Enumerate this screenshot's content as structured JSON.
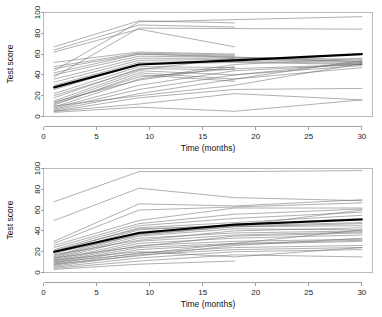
{
  "figure": {
    "title": "",
    "panel_count": 2
  },
  "chart_data": [
    {
      "type": "line",
      "title": "",
      "panel": "top",
      "xlabel": "Time (months)",
      "ylabel": "Test score",
      "xlim": [
        0,
        31
      ],
      "ylim": [
        0,
        100
      ],
      "xticks": [
        0,
        5,
        10,
        15,
        20,
        25,
        30
      ],
      "xtick_labels": [
        "0",
        "5",
        "10",
        "15",
        "20",
        "25",
        "30"
      ],
      "yticks": [
        0,
        20,
        40,
        60,
        80,
        100
      ],
      "ytick_labels": [
        "0",
        "20",
        "40",
        "60",
        "80",
        "100"
      ],
      "grid": false,
      "legend": "none",
      "series": [
        {
          "name": "mean",
          "emphasis": "thick-black",
          "x": [
            1,
            9,
            18,
            30
          ],
          "values": [
            28,
            50,
            54,
            60
          ]
        },
        {
          "name": "subject-01",
          "x": [
            1,
            9,
            30
          ],
          "values": [
            44,
            91,
            96
          ]
        },
        {
          "name": "subject-02",
          "x": [
            1,
            9,
            30
          ],
          "values": [
            38,
            85,
            84
          ]
        },
        {
          "name": "subject-03",
          "x": [
            1,
            9,
            18
          ],
          "values": [
            67,
            92,
            90
          ]
        },
        {
          "name": "subject-04",
          "x": [
            1,
            9,
            18
          ],
          "values": [
            64,
            88,
            86
          ]
        },
        {
          "name": "subject-05",
          "x": [
            1,
            9,
            18
          ],
          "values": [
            62,
            84,
            67
          ]
        },
        {
          "name": "subject-06",
          "x": [
            1,
            9,
            18
          ],
          "values": [
            52,
            62,
            60
          ]
        },
        {
          "name": "subject-07",
          "x": [
            1,
            9,
            18
          ],
          "values": [
            46,
            60,
            58
          ]
        },
        {
          "name": "subject-08",
          "x": [
            1,
            9,
            18,
            30
          ],
          "values": [
            40,
            58,
            57,
            55
          ]
        },
        {
          "name": "subject-09",
          "x": [
            1,
            9,
            18,
            30
          ],
          "values": [
            36,
            56,
            56,
            53
          ]
        },
        {
          "name": "subject-10",
          "x": [
            1,
            9,
            18,
            30
          ],
          "values": [
            33,
            54,
            55,
            52
          ]
        },
        {
          "name": "subject-11",
          "x": [
            1,
            9,
            18,
            30
          ],
          "values": [
            30,
            52,
            53,
            51
          ]
        },
        {
          "name": "subject-12",
          "x": [
            1,
            9,
            18,
            30
          ],
          "values": [
            26,
            50,
            52,
            50
          ]
        },
        {
          "name": "subject-13",
          "x": [
            1,
            9,
            18
          ],
          "values": [
            22,
            48,
            47
          ]
        },
        {
          "name": "subject-14",
          "x": [
            1,
            9,
            18
          ],
          "values": [
            18,
            46,
            45
          ]
        },
        {
          "name": "subject-15",
          "x": [
            1,
            9,
            18,
            30
          ],
          "values": [
            15,
            44,
            40,
            52
          ]
        },
        {
          "name": "subject-16",
          "x": [
            1,
            9,
            18,
            30
          ],
          "values": [
            13,
            42,
            36,
            54
          ]
        },
        {
          "name": "subject-17",
          "x": [
            1,
            9,
            18
          ],
          "values": [
            11,
            40,
            34
          ]
        },
        {
          "name": "subject-18",
          "x": [
            1,
            9,
            18,
            30
          ],
          "values": [
            9,
            36,
            50,
            56
          ]
        },
        {
          "name": "subject-19",
          "x": [
            1,
            9,
            18,
            30
          ],
          "values": [
            8,
            30,
            44,
            50
          ]
        },
        {
          "name": "subject-20",
          "x": [
            1,
            9,
            18,
            30
          ],
          "values": [
            7,
            26,
            40,
            49
          ]
        },
        {
          "name": "subject-21",
          "x": [
            1,
            9,
            18,
            30
          ],
          "values": [
            6,
            22,
            36,
            47
          ]
        },
        {
          "name": "subject-22",
          "x": [
            1,
            9,
            18,
            30
          ],
          "values": [
            5,
            18,
            26,
            27
          ]
        },
        {
          "name": "subject-23",
          "x": [
            1,
            9,
            18,
            30
          ],
          "values": [
            5,
            12,
            22,
            16
          ]
        },
        {
          "name": "subject-24",
          "x": [
            1,
            9,
            18,
            30
          ],
          "values": [
            4,
            9,
            5,
            16
          ]
        },
        {
          "name": "subject-25",
          "x": [
            1,
            9,
            18
          ],
          "values": [
            14,
            35,
            48
          ]
        },
        {
          "name": "subject-26",
          "x": [
            1,
            9,
            18
          ],
          "values": [
            20,
            45,
            56
          ]
        },
        {
          "name": "subject-27",
          "x": [
            1,
            9,
            30
          ],
          "values": [
            42,
            60,
            53
          ]
        },
        {
          "name": "subject-28",
          "x": [
            1,
            9,
            18
          ],
          "values": [
            48,
            61,
            59
          ]
        },
        {
          "name": "subject-29",
          "x": [
            1,
            9,
            18,
            30
          ],
          "values": [
            10,
            20,
            30,
            51
          ]
        },
        {
          "name": "subject-30",
          "x": [
            1,
            9,
            18,
            30
          ],
          "values": [
            12,
            38,
            46,
            50
          ]
        }
      ]
    },
    {
      "type": "line",
      "title": "",
      "panel": "bottom",
      "xlabel": "Time (months)",
      "ylabel": "Test score",
      "xlim": [
        0,
        31
      ],
      "ylim": [
        0,
        100
      ],
      "xticks": [
        0,
        5,
        10,
        15,
        20,
        25,
        30
      ],
      "xtick_labels": [
        "0",
        "5",
        "10",
        "15",
        "20",
        "25",
        "30"
      ],
      "yticks": [
        0,
        20,
        40,
        60,
        80,
        100
      ],
      "ytick_labels": [
        "0",
        "20",
        "40",
        "60",
        "80",
        "100"
      ],
      "grid": false,
      "legend": "none",
      "series": [
        {
          "name": "mean",
          "emphasis": "thick-black",
          "x": [
            1,
            9,
            18,
            30
          ],
          "values": [
            20,
            38,
            46,
            51
          ]
        },
        {
          "name": "subject-01",
          "x": [
            1,
            9,
            18,
            30
          ],
          "values": [
            68,
            97,
            97,
            98
          ]
        },
        {
          "name": "subject-02",
          "x": [
            1,
            9,
            18,
            30
          ],
          "values": [
            50,
            81,
            72,
            69
          ]
        },
        {
          "name": "subject-03",
          "x": [
            1,
            9,
            18,
            30
          ],
          "values": [
            30,
            66,
            64,
            70
          ]
        },
        {
          "name": "subject-04",
          "x": [
            1,
            9,
            18,
            30
          ],
          "values": [
            28,
            60,
            63,
            67
          ]
        },
        {
          "name": "subject-05",
          "x": [
            1,
            9,
            18,
            30
          ],
          "values": [
            26,
            50,
            62,
            62
          ]
        },
        {
          "name": "subject-06",
          "x": [
            1,
            9,
            18,
            30
          ],
          "values": [
            24,
            47,
            56,
            61
          ]
        },
        {
          "name": "subject-07",
          "x": [
            1,
            9,
            18,
            30
          ],
          "values": [
            22,
            45,
            52,
            58
          ]
        },
        {
          "name": "subject-08",
          "x": [
            1,
            9,
            18,
            30
          ],
          "values": [
            20,
            43,
            48,
            55
          ]
        },
        {
          "name": "subject-09",
          "x": [
            1,
            9,
            18,
            30
          ],
          "values": [
            18,
            41,
            46,
            52
          ]
        },
        {
          "name": "subject-10",
          "x": [
            1,
            9,
            18,
            30
          ],
          "values": [
            16,
            39,
            45,
            48
          ]
        },
        {
          "name": "subject-11",
          "x": [
            1,
            9,
            18,
            30
          ],
          "values": [
            15,
            37,
            44,
            45
          ]
        },
        {
          "name": "subject-12",
          "x": [
            1,
            9,
            18,
            30
          ],
          "values": [
            14,
            35,
            42,
            41
          ]
        },
        {
          "name": "subject-13",
          "x": [
            1,
            9,
            18,
            30
          ],
          "values": [
            13,
            33,
            38,
            40
          ]
        },
        {
          "name": "subject-14",
          "x": [
            1,
            9,
            18,
            30
          ],
          "values": [
            12,
            30,
            36,
            39
          ]
        },
        {
          "name": "subject-15",
          "x": [
            1,
            9,
            18,
            30
          ],
          "values": [
            11,
            28,
            33,
            36
          ]
        },
        {
          "name": "subject-16",
          "x": [
            1,
            9,
            18,
            30
          ],
          "values": [
            10,
            26,
            30,
            32
          ]
        },
        {
          "name": "subject-17",
          "x": [
            1,
            9,
            18,
            30
          ],
          "values": [
            9,
            24,
            28,
            31
          ]
        },
        {
          "name": "subject-18",
          "x": [
            1,
            9,
            18,
            30
          ],
          "values": [
            8,
            22,
            27,
            30
          ]
        },
        {
          "name": "subject-19",
          "x": [
            1,
            9,
            18,
            30
          ],
          "values": [
            7,
            19,
            24,
            26
          ]
        },
        {
          "name": "subject-20",
          "x": [
            1,
            9,
            18,
            30
          ],
          "values": [
            6,
            17,
            22,
            24
          ]
        },
        {
          "name": "subject-21",
          "x": [
            1,
            9,
            18,
            30
          ],
          "values": [
            5,
            14,
            20,
            22
          ]
        },
        {
          "name": "subject-22",
          "x": [
            1,
            9,
            18,
            30
          ],
          "values": [
            4,
            11,
            17,
            15
          ]
        },
        {
          "name": "subject-23",
          "x": [
            1,
            9,
            18
          ],
          "values": [
            3,
            8,
            11
          ]
        },
        {
          "name": "subject-24",
          "x": [
            1,
            9,
            18,
            30
          ],
          "values": [
            12,
            20,
            15,
            24
          ]
        },
        {
          "name": "subject-25",
          "x": [
            1,
            9,
            18,
            30
          ],
          "values": [
            17,
            31,
            40,
            43
          ]
        },
        {
          "name": "subject-26",
          "x": [
            1,
            9,
            18,
            30
          ],
          "values": [
            21,
            42,
            45,
            60
          ]
        },
        {
          "name": "subject-27",
          "x": [
            1,
            9,
            18,
            30
          ],
          "values": [
            19,
            36,
            44,
            47
          ]
        },
        {
          "name": "subject-28",
          "x": [
            1,
            9,
            18,
            30
          ],
          "values": [
            10,
            18,
            28,
            41
          ]
        },
        {
          "name": "subject-29",
          "x": [
            1,
            9,
            18,
            30
          ],
          "values": [
            8,
            16,
            26,
            33
          ]
        },
        {
          "name": "subject-30",
          "x": [
            1,
            9,
            18,
            30
          ],
          "values": [
            14,
            25,
            35,
            38
          ]
        }
      ]
    }
  ]
}
